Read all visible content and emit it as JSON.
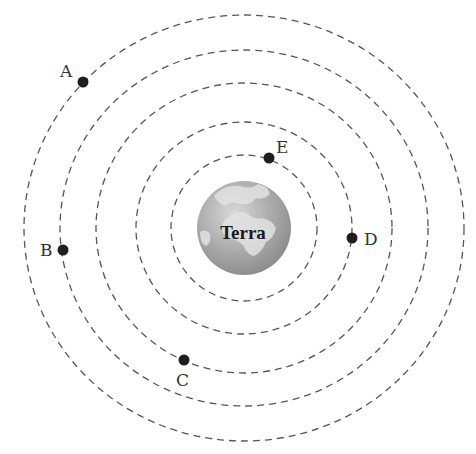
{
  "diagram": {
    "center": {
      "x": 244,
      "y": 228
    },
    "earth": {
      "label": "Terra",
      "radius": 47,
      "ocean_color": "#9a9a9a",
      "land_color": "#d4d4d4"
    },
    "orbit_color": "#555555",
    "orbits": [
      {
        "id": 1,
        "rx": 220,
        "ry": 213
      },
      {
        "id": 2,
        "rx": 184,
        "ry": 178
      },
      {
        "id": 3,
        "rx": 148,
        "ry": 145
      },
      {
        "id": 4,
        "rx": 108,
        "ry": 106
      },
      {
        "id": 5,
        "rx": 73,
        "ry": 73
      }
    ],
    "bodies": [
      {
        "label": "A",
        "orbit": 1,
        "x": 83,
        "y": 82,
        "label_x": 60,
        "label_y": 77
      },
      {
        "label": "B",
        "orbit": 2,
        "x": 63,
        "y": 250,
        "label_x": 40,
        "label_y": 256
      },
      {
        "label": "C",
        "orbit": 3,
        "x": 184,
        "y": 360,
        "label_x": 176,
        "label_y": 386
      },
      {
        "label": "D",
        "orbit": 4,
        "x": 352,
        "y": 238,
        "label_x": 364,
        "label_y": 245
      },
      {
        "label": "E",
        "orbit": 5,
        "x": 269,
        "y": 158,
        "label_x": 276,
        "label_y": 153
      }
    ]
  }
}
